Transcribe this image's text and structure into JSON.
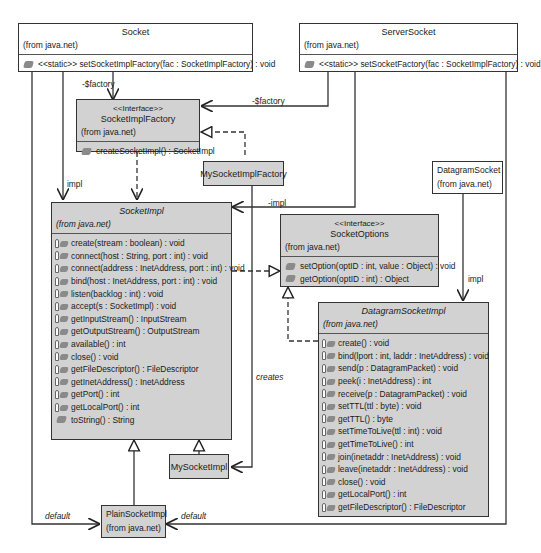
{
  "diagram": {
    "type": "UML class diagram",
    "classes": {
      "socket": {
        "name": "Socket",
        "from": "(from java.net)",
        "operations": [
          {
            "visibility": "public",
            "icon": "public-operation-icon",
            "text": "<<static>> setSocketImplFactory(fac : SocketImplFactory) : void"
          }
        ]
      },
      "server_socket": {
        "name": "ServerSocket",
        "from": "(from java.net)",
        "operations": [
          {
            "visibility": "public",
            "icon": "public-operation-icon",
            "text": "<<static>> setSocketFactory(fac : SocketImplFactory) : void"
          }
        ]
      },
      "socket_impl_factory": {
        "stereotype": "<<Interface>>",
        "name": "SocketImplFactory",
        "from": "(from java.net)",
        "operations": [
          {
            "visibility": "public",
            "icon": "public-operation-icon",
            "text": "createSocketImpl() : SocketImpl"
          }
        ]
      },
      "my_socket_impl_factory": {
        "name": "MySocketImplFactory"
      },
      "socket_impl": {
        "name": "SocketImpl",
        "from": "(from java.net)",
        "abstract": true,
        "operations": [
          {
            "visibility": "protected",
            "icon": "protected-operation-icon",
            "text": "create(stream : boolean) : void"
          },
          {
            "visibility": "protected",
            "icon": "protected-operation-icon",
            "text": "connect(host : String, port : int) : void"
          },
          {
            "visibility": "protected",
            "icon": "protected-operation-icon",
            "text": "connect(address : InetAddress, port : int) : void"
          },
          {
            "visibility": "protected",
            "icon": "protected-operation-icon",
            "text": "bind(host : InetAddress, port : int) : void"
          },
          {
            "visibility": "protected",
            "icon": "protected-operation-icon",
            "text": "listen(backlog : int) : void"
          },
          {
            "visibility": "protected",
            "icon": "protected-operation-icon",
            "text": "accept(s : SocketImpl) : void"
          },
          {
            "visibility": "protected",
            "icon": "protected-operation-icon",
            "text": "getInputStream() : InputStream"
          },
          {
            "visibility": "protected",
            "icon": "protected-operation-icon",
            "text": "getOutputStream() : OutputStream"
          },
          {
            "visibility": "protected",
            "icon": "protected-operation-icon",
            "text": "available() : int"
          },
          {
            "visibility": "protected",
            "icon": "protected-operation-icon",
            "text": "close() : void"
          },
          {
            "visibility": "protected",
            "icon": "protected-operation-icon",
            "text": "getFileDescriptor() : FileDescriptor"
          },
          {
            "visibility": "protected",
            "icon": "protected-operation-icon",
            "text": "getInetAddress() : InetAddress"
          },
          {
            "visibility": "protected",
            "icon": "protected-operation-icon",
            "text": "getPort() : int"
          },
          {
            "visibility": "protected",
            "icon": "protected-operation-icon",
            "text": "getLocalPort() : int"
          },
          {
            "visibility": "public",
            "icon": "public-operation-icon",
            "text": "toString() : String"
          }
        ]
      },
      "socket_options": {
        "stereotype": "<<Interface>>",
        "name": "SocketOptions",
        "from": "(from java.net)",
        "operations": [
          {
            "visibility": "public",
            "icon": "public-operation-icon",
            "text": "setOption(optID : int, value : Object) : void"
          },
          {
            "visibility": "public",
            "icon": "public-operation-icon",
            "text": "getOption(optID : int) : Object"
          }
        ]
      },
      "datagram_socket": {
        "name": "DatagramSocket",
        "from": "(from java.net)"
      },
      "datagram_socket_impl": {
        "name": "DatagramSocketImpl",
        "from": "(from java.net)",
        "abstract": true,
        "operations": [
          {
            "visibility": "protected",
            "icon": "protected-operation-icon",
            "text": "create() : void"
          },
          {
            "visibility": "protected",
            "icon": "protected-operation-icon",
            "text": "bind(lport : int, laddr : InetAddress) : void"
          },
          {
            "visibility": "protected",
            "icon": "protected-operation-icon",
            "text": "send(p : DatagramPacket) : void"
          },
          {
            "visibility": "protected",
            "icon": "protected-operation-icon",
            "text": "peek(i : InetAddress) : int"
          },
          {
            "visibility": "protected",
            "icon": "protected-operation-icon",
            "text": "receive(p : DatagramPacket) : void"
          },
          {
            "visibility": "protected",
            "icon": "protected-operation-icon",
            "text": "setTTL(ttl : byte) : void"
          },
          {
            "visibility": "protected",
            "icon": "protected-operation-icon",
            "text": "getTTL() : byte"
          },
          {
            "visibility": "protected",
            "icon": "protected-operation-icon",
            "text": "setTimeToLive(ttl : int) : void"
          },
          {
            "visibility": "protected",
            "icon": "protected-operation-icon",
            "text": "getTimeToLive() : int"
          },
          {
            "visibility": "protected",
            "icon": "protected-operation-icon",
            "text": "join(inetaddr : InetAddress) : void"
          },
          {
            "visibility": "protected",
            "icon": "protected-operation-icon",
            "text": "leave(inetaddr : InetAddress) : void"
          },
          {
            "visibility": "protected",
            "icon": "protected-operation-icon",
            "text": "close() : void"
          },
          {
            "visibility": "protected",
            "icon": "protected-operation-icon",
            "text": "getLocalPort() : int"
          },
          {
            "visibility": "protected",
            "icon": "protected-operation-icon",
            "text": "getFileDescriptor() : FileDescriptor"
          }
        ]
      },
      "my_socket_impl": {
        "name": "MySocketImpl"
      },
      "plain_socket_impl": {
        "name": "PlainSocketImpl",
        "from": "(from java.net)"
      }
    },
    "relationship_labels": {
      "socket_factory": "-$factory",
      "server_socket_factory": "-$factory",
      "socket_impl": "impl",
      "server_socket_impl": "-impl",
      "datagram_impl": "impl",
      "creates": "creates",
      "default_left": "default",
      "default_right": "default"
    },
    "colors": {
      "concrete_fill": "#ffffff",
      "abstract_fill": "#d2d2d2",
      "line": "#333333"
    }
  }
}
